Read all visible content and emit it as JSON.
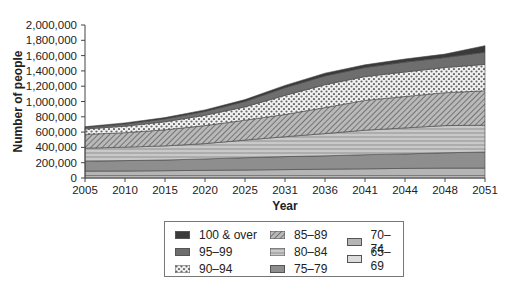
{
  "chart_data": {
    "type": "area",
    "stacked": true,
    "title": "",
    "xlabel": "Year",
    "ylabel": "Number of people",
    "ylim": [
      0,
      2000000
    ],
    "yticks": [
      0,
      200000,
      400000,
      600000,
      800000,
      1000000,
      1200000,
      1400000,
      1600000,
      1800000,
      2000000
    ],
    "ytick_labels": [
      "0",
      "200,000",
      "400,000",
      "600,000",
      "800,000",
      "1,000,000",
      "1,200,000",
      "1,400,000",
      "1,600,000",
      "1,800,000",
      "2,000,000"
    ],
    "categories": [
      "2005",
      "2010",
      "2015",
      "2020",
      "2025",
      "2031",
      "2036",
      "2041",
      "2044",
      "2048",
      "2051"
    ],
    "grid": false,
    "legend_position": "bottom",
    "series": [
      {
        "name": "65–69",
        "pattern": "light-solid",
        "color": "#d8d8d8",
        "values": [
          30000,
          30000,
          30000,
          30000,
          30000,
          30000,
          30000,
          30000,
          30000,
          30000,
          30000
        ]
      },
      {
        "name": "70–74",
        "pattern": "solid",
        "color": "#b5b5b5",
        "values": [
          60000,
          62000,
          65000,
          70000,
          75000,
          80000,
          85000,
          90000,
          95000,
          100000,
          100000
        ]
      },
      {
        "name": "75–79",
        "pattern": "solid",
        "color": "#8e8e8e",
        "values": [
          130000,
          135000,
          140000,
          150000,
          160000,
          170000,
          175000,
          185000,
          190000,
          200000,
          210000
        ]
      },
      {
        "name": "80–84",
        "pattern": "horizontal-lines",
        "color": "#bdbdbd",
        "values": [
          170000,
          175000,
          185000,
          200000,
          230000,
          260000,
          290000,
          320000,
          340000,
          355000,
          350000
        ]
      },
      {
        "name": "85–89",
        "pattern": "diagonal-hatch",
        "color": "#9a9a9a",
        "values": [
          180000,
          190000,
          210000,
          235000,
          260000,
          290000,
          340000,
          390000,
          410000,
          430000,
          450000
        ]
      },
      {
        "name": "90–94",
        "pattern": "dots",
        "color": "#e6e6e6",
        "values": [
          70000,
          85000,
          105000,
          135000,
          175000,
          250000,
          300000,
          310000,
          320000,
          330000,
          345000
        ]
      },
      {
        "name": "95–99",
        "pattern": "solid",
        "color": "#6e6e6e",
        "values": [
          20000,
          28000,
          38000,
          50000,
          70000,
          100000,
          115000,
          120000,
          130000,
          130000,
          160000
        ]
      },
      {
        "name": "100 & over",
        "pattern": "solid",
        "color": "#3a3a3a",
        "values": [
          10000,
          15000,
          17000,
          20000,
          25000,
          30000,
          35000,
          35000,
          40000,
          45000,
          85000
        ]
      }
    ]
  },
  "legend": {
    "items": [
      {
        "label": "100 & over"
      },
      {
        "label": "95–99"
      },
      {
        "label": "90–94"
      },
      {
        "label": "85–89"
      },
      {
        "label": "80–84"
      },
      {
        "label": "75–79"
      },
      {
        "label": "70–74"
      },
      {
        "label": "65–69"
      }
    ]
  }
}
